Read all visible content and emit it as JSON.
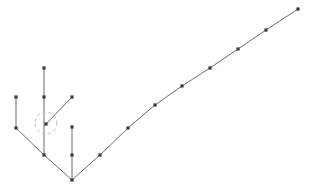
{
  "canvas": {
    "width": 310,
    "height": 193,
    "background": "#ffffff"
  },
  "style": {
    "edge_color": "#6b6b73",
    "edge_width": 1.0,
    "node_color": "#3a3a42",
    "node_radius": 1.6,
    "highlight_color": "#b9b9bd",
    "highlight_dash": "3 3",
    "highlight_width": 1.0
  },
  "chart_data": {
    "type": "line",
    "title": "",
    "subtitle": "",
    "xlabel": "",
    "ylabel": "",
    "grid": false,
    "legend": null,
    "axis": {
      "visible": false,
      "xlim": [
        0,
        310
      ],
      "ylim": [
        193,
        0
      ]
    },
    "series": [
      {
        "name": "main-trunk",
        "role": "primary-polyline",
        "points": [
          [
            72,
            180
          ],
          [
            100,
            155
          ],
          [
            128,
            128
          ],
          [
            155,
            105
          ],
          [
            182,
            86
          ],
          [
            210,
            68
          ],
          [
            238,
            49
          ],
          [
            266,
            30
          ],
          [
            298,
            9
          ]
        ]
      },
      {
        "name": "left-arm",
        "role": "secondary-polyline",
        "points": [
          [
            72,
            180
          ],
          [
            44,
            155
          ],
          [
            16,
            128
          ],
          [
            16,
            97
          ]
        ]
      },
      {
        "name": "branch-tall-center",
        "role": "branch-stem",
        "points": [
          [
            44,
            155
          ],
          [
            44,
            97
          ],
          [
            44,
            68
          ]
        ]
      },
      {
        "name": "branch-diagonal-upright",
        "role": "branch-stem",
        "points": [
          [
            46,
            124
          ],
          [
            72,
            97
          ]
        ]
      },
      {
        "name": "branch-short-right",
        "role": "branch-stem",
        "points": [
          [
            72,
            180
          ],
          [
            72,
            155
          ],
          [
            72,
            127
          ]
        ]
      }
    ],
    "nodes": [
      {
        "id": "apex",
        "x": 72,
        "y": 180,
        "label": ""
      },
      {
        "id": "trunk-1",
        "x": 100,
        "y": 155,
        "label": ""
      },
      {
        "id": "trunk-2",
        "x": 128,
        "y": 128,
        "label": ""
      },
      {
        "id": "trunk-3",
        "x": 155,
        "y": 105,
        "label": ""
      },
      {
        "id": "trunk-4",
        "x": 182,
        "y": 86,
        "label": ""
      },
      {
        "id": "trunk-5",
        "x": 210,
        "y": 68,
        "label": ""
      },
      {
        "id": "trunk-6",
        "x": 238,
        "y": 49,
        "label": ""
      },
      {
        "id": "trunk-7",
        "x": 266,
        "y": 30,
        "label": ""
      },
      {
        "id": "trunk-tip",
        "x": 298,
        "y": 9,
        "label": ""
      },
      {
        "id": "arm-1",
        "x": 44,
        "y": 155,
        "label": ""
      },
      {
        "id": "arm-2",
        "x": 16,
        "y": 128,
        "label": ""
      },
      {
        "id": "arm-tip",
        "x": 16,
        "y": 97,
        "label": ""
      },
      {
        "id": "stem-center-mid",
        "x": 44,
        "y": 97,
        "label": ""
      },
      {
        "id": "stem-center-tip",
        "x": 44,
        "y": 68,
        "label": ""
      },
      {
        "id": "stem-diagonal-base",
        "x": 46,
        "y": 124,
        "label": ""
      },
      {
        "id": "stem-diagonal-tip",
        "x": 72,
        "y": 97,
        "label": ""
      },
      {
        "id": "stem-right-mid",
        "x": 72,
        "y": 155,
        "label": ""
      },
      {
        "id": "stem-right-tip",
        "x": 72,
        "y": 127,
        "label": ""
      }
    ],
    "annotations": [
      {
        "id": "junction-highlight",
        "type": "dashed-circle",
        "cx": 46,
        "cy": 123,
        "r": 11,
        "label": ""
      }
    ]
  }
}
